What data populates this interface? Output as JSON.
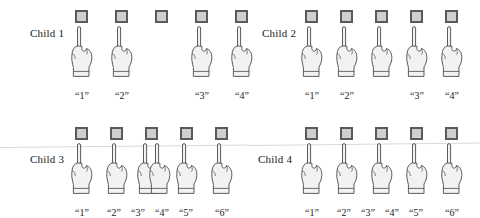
{
  "figure": {
    "colors": {
      "square_fill": "#cfcfcf",
      "square_border": "#5a5a5a",
      "hand_fill": "#f2f2f2",
      "hand_stroke": "#4a4a4a",
      "text": "#1a1a1a",
      "scanline": "#d9d9d9",
      "background": "#ffffff"
    }
  },
  "panels": [
    {
      "id": "child-1",
      "label": "Child 1",
      "label_x": 30,
      "label_y": 27,
      "origin_x": 75,
      "origin_y": 10,
      "squares": [
        {
          "x": 0,
          "y": 0
        },
        {
          "x": 40,
          "y": 0
        },
        {
          "x": 80,
          "y": 0
        },
        {
          "x": 120,
          "y": 0
        },
        {
          "x": 160,
          "y": 0
        }
      ],
      "hands": [
        {
          "x": -8,
          "y": 14
        },
        {
          "x": 32,
          "y": 14
        },
        {
          "x": 112,
          "y": 14
        },
        {
          "x": 152,
          "y": 14
        }
      ],
      "counts": [
        {
          "text": "“1”",
          "x": -8,
          "y": 80
        },
        {
          "text": "“2”",
          "x": 32,
          "y": 80
        },
        {
          "text": "“3”",
          "x": 112,
          "y": 80
        },
        {
          "text": "“4”",
          "x": 152,
          "y": 80
        }
      ]
    },
    {
      "id": "child-2",
      "label": "Child 2",
      "label_x": 262,
      "label_y": 27,
      "origin_x": 305,
      "origin_y": 10,
      "squares": [
        {
          "x": 0,
          "y": 0
        },
        {
          "x": 35,
          "y": 0
        },
        {
          "x": 70,
          "y": 0
        },
        {
          "x": 105,
          "y": 0
        },
        {
          "x": 140,
          "y": 0
        }
      ],
      "hands": [
        {
          "x": -8,
          "y": 14
        },
        {
          "x": 27,
          "y": 14
        },
        {
          "x": 62,
          "y": 14
        },
        {
          "x": 97,
          "y": 14
        },
        {
          "x": 132,
          "y": 14
        }
      ],
      "counts": [
        {
          "text": "“1”",
          "x": -8,
          "y": 80
        },
        {
          "text": "“2”",
          "x": 27,
          "y": 80
        },
        {
          "text": "“3”",
          "x": 97,
          "y": 80
        },
        {
          "text": "“4”",
          "x": 132,
          "y": 80
        }
      ]
    },
    {
      "id": "child-3",
      "label": "Child 3",
      "label_x": 30,
      "label_y": 153,
      "origin_x": 75,
      "origin_y": 127,
      "squares": [
        {
          "x": 0,
          "y": 0
        },
        {
          "x": 35,
          "y": 0
        },
        {
          "x": 70,
          "y": 0
        },
        {
          "x": 105,
          "y": 0
        },
        {
          "x": 140,
          "y": 0
        }
      ],
      "hands": [
        {
          "x": -8,
          "y": 14
        },
        {
          "x": 27,
          "y": 14
        },
        {
          "x": 58,
          "y": 14
        },
        {
          "x": 70,
          "y": 14
        },
        {
          "x": 97,
          "y": 14
        },
        {
          "x": 132,
          "y": 14
        }
      ],
      "counts": [
        {
          "text": "“1”",
          "x": -8,
          "y": 80
        },
        {
          "text": "“2”",
          "x": 24,
          "y": 80
        },
        {
          "text": "“3”",
          "x": 48,
          "y": 80
        },
        {
          "text": "“4”",
          "x": 72,
          "y": 80
        },
        {
          "text": "“5”",
          "x": 96,
          "y": 80
        },
        {
          "text": "“6”",
          "x": 132,
          "y": 80
        }
      ]
    },
    {
      "id": "child-4",
      "label": "Child 4",
      "label_x": 258,
      "label_y": 153,
      "origin_x": 305,
      "origin_y": 127,
      "squares": [
        {
          "x": 0,
          "y": 0
        },
        {
          "x": 35,
          "y": 0
        },
        {
          "x": 70,
          "y": 0
        },
        {
          "x": 105,
          "y": 0
        },
        {
          "x": 140,
          "y": 0
        }
      ],
      "hands": [
        {
          "x": -8,
          "y": 14
        },
        {
          "x": 27,
          "y": 14
        },
        {
          "x": 62,
          "y": 14
        },
        {
          "x": 97,
          "y": 14
        },
        {
          "x": 132,
          "y": 14
        }
      ],
      "counts": [
        {
          "text": "“1”",
          "x": -8,
          "y": 80
        },
        {
          "text": "“2”",
          "x": 24,
          "y": 80
        },
        {
          "text": "“3”",
          "x": 48,
          "y": 80
        },
        {
          "text": "“4”",
          "x": 72,
          "y": 80
        },
        {
          "text": "“5”",
          "x": 96,
          "y": 80
        },
        {
          "text": "“6”",
          "x": 132,
          "y": 80
        }
      ]
    }
  ],
  "scanlines": [
    {
      "y": 147,
      "x": 0,
      "width": 250,
      "rotate": -0.6
    },
    {
      "y": 145,
      "x": 250,
      "width": 230,
      "rotate": -0.6
    }
  ]
}
